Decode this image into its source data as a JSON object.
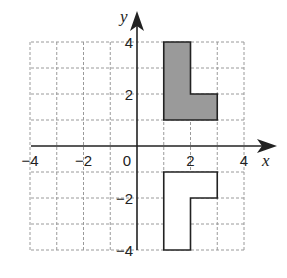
{
  "diagram": {
    "type": "coordinate-grid",
    "x_axis_label": "x",
    "y_axis_label": "y",
    "x_range": [
      -4,
      4
    ],
    "y_range": [
      -4,
      4
    ],
    "grid_step": 1,
    "x_tick_labels": [
      {
        "value": -4,
        "text": "−4"
      },
      {
        "value": -2,
        "text": "−2"
      },
      {
        "value": 0,
        "text": "0"
      },
      {
        "value": 2,
        "text": "2"
      },
      {
        "value": 4,
        "text": "4"
      }
    ],
    "y_tick_labels": [
      {
        "value": 4,
        "text": "4"
      },
      {
        "value": 2,
        "text": "2"
      },
      {
        "value": -2,
        "text": "−2"
      },
      {
        "value": -4,
        "text": "−4"
      }
    ],
    "shapes": [
      {
        "name": "shaded-L-figure",
        "fill": "#9a9a9a",
        "stroke": "#222222",
        "vertices": [
          [
            1,
            4
          ],
          [
            2,
            4
          ],
          [
            2,
            2
          ],
          [
            3,
            2
          ],
          [
            3,
            1
          ],
          [
            1,
            1
          ]
        ]
      },
      {
        "name": "unshaded-L-figure",
        "fill": "#ffffff",
        "stroke": "#222222",
        "vertices": [
          [
            1,
            -1
          ],
          [
            3,
            -1
          ],
          [
            3,
            -2
          ],
          [
            2,
            -2
          ],
          [
            2,
            -4
          ],
          [
            1,
            -4
          ]
        ]
      }
    ],
    "colors": {
      "grid": "#9a9a9a",
      "axis": "#222222",
      "shaded_fill": "#9a9a9a"
    }
  }
}
